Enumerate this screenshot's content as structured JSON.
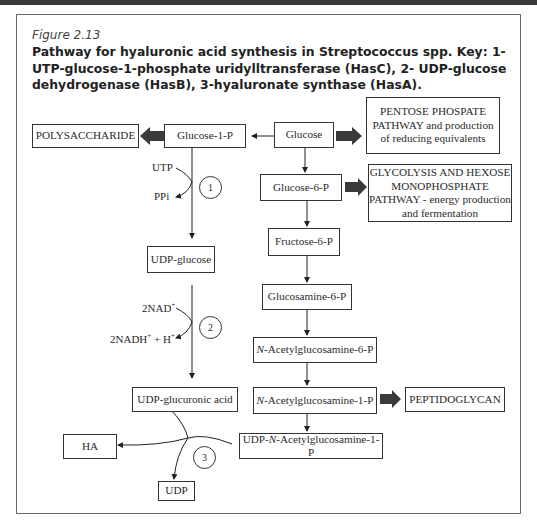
{
  "figure": {
    "label": "Figure 2.13",
    "caption": "Pathway for hyaluronic acid synthesis in Streptococcus spp. Key: 1- UTP-glucose-1-phosphate uridylltransferase (HasC), 2- UDP-glucose dehydrogenase (HasB), 3-hyaluronate synthase (HasA)."
  },
  "nodes": {
    "polysaccharide": "POLYSACCHARIDE",
    "glucose_1_p": "Glucose-1-P",
    "glucose": "Glucose",
    "pentose_line1": "PENTOSE PHOSPATE",
    "pentose_line2": "PATHWAY and production",
    "pentose_line3": "of reducing equivalents",
    "glucose_6_p": "Glucose-6-P",
    "glycolysis_line1": "GLYCOLYSIS AND HEXOSE",
    "glycolysis_line2": "MONOPHOSPHATE",
    "glycolysis_line3": "PATHWAY - energy production",
    "glycolysis_line4": "and fermentation",
    "fructose_6_p": "Fructose-6-P",
    "udp_glucose": "UDP-glucose",
    "glucosamine_6_p": "Glucosamine-6-P",
    "n_prefix": "N",
    "acetylglucosamine_6_p_rest": "-Acetylglucosamine-6-P",
    "acetylglucosamine_1_p_rest": "-Acetylglucosamine-1-P",
    "udp_glucuronic_acid": "UDP-glucuronic acid",
    "peptidoglycan": "PEPTIDOGLYCAN",
    "udp_prefix": "UDP-",
    "udp_n_acetylglucosamine_1_p_rest": "-Acetylglucosamine-1-P",
    "ha": "HA",
    "udp": "UDP"
  },
  "cofactors": {
    "utp": "UTP",
    "ppi": "PPi",
    "nad": "2NAD",
    "nad_sup": "+",
    "nadh": "2NADH",
    "nadh_sup": "+",
    "plus_h": " + H",
    "h_sup": "+"
  },
  "enzymes": {
    "step1": "1",
    "step2": "2",
    "step3": "3"
  },
  "colors": {
    "thick_arrow": "#3a3a3a",
    "frame": "#6a6a6a"
  }
}
